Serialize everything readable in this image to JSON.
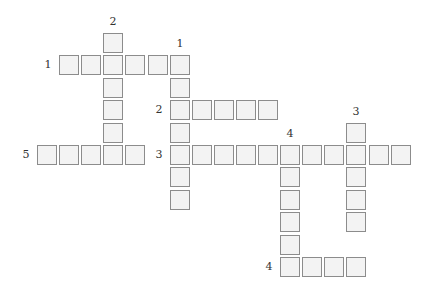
{
  "puzzle": {
    "type": "crossword",
    "grid": {
      "origin_x": 37,
      "origin_y": 33,
      "pitch_x": 22.1,
      "pitch_y": 22.4
    },
    "colors": {
      "cell_fill": "#f3f3f3",
      "cell_border": "#8c8c8c",
      "label": "#333333"
    },
    "words": [
      {
        "id": "1-across",
        "number": "1",
        "dir": "across",
        "row": 1,
        "col": 1,
        "length": 6
      },
      {
        "id": "1-down",
        "number": "1",
        "dir": "down",
        "row": 1,
        "col": 6,
        "length": 7
      },
      {
        "id": "2-down",
        "number": "2",
        "dir": "down",
        "row": 0,
        "col": 3,
        "length": 6
      },
      {
        "id": "2-across",
        "number": "2",
        "dir": "across",
        "row": 3,
        "col": 6,
        "length": 5
      },
      {
        "id": "3-across",
        "number": "3",
        "dir": "across",
        "row": 5,
        "col": 6,
        "length": 11
      },
      {
        "id": "3-down",
        "number": "3",
        "dir": "down",
        "row": 4,
        "col": 14,
        "length": 5
      },
      {
        "id": "4-down",
        "number": "4",
        "dir": "down",
        "row": 5,
        "col": 11,
        "length": 6
      },
      {
        "id": "4-across",
        "number": "4",
        "dir": "across",
        "row": 10,
        "col": 11,
        "length": 4
      },
      {
        "id": "5-across",
        "number": "5",
        "dir": "across",
        "row": 5,
        "col": 0,
        "length": 5
      }
    ]
  }
}
